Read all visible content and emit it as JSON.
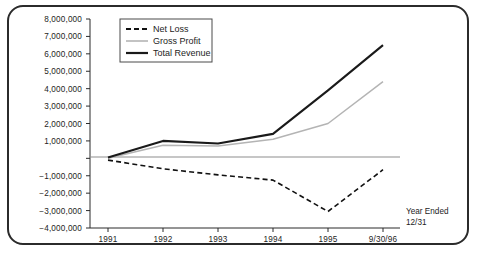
{
  "chart_data": {
    "type": "line",
    "title": "",
    "xlabel": "Year Ended 12/31",
    "ylabel": "",
    "categories": [
      "1991",
      "1992",
      "1993",
      "1994",
      "1995",
      "9/30/96"
    ],
    "ylim": [
      -4000000,
      8000000
    ],
    "ytick_values": [
      8000000,
      7000000,
      6000000,
      5000000,
      4000000,
      3000000,
      2000000,
      1000000,
      0,
      -1000000,
      -2000000,
      -3000000,
      -4000000
    ],
    "ytick_labels": [
      "8,000,000",
      "7,000,000",
      "6,000,000",
      "5,000,000",
      "4,000,000",
      "3,000,000",
      "2,000,000",
      "1,000,000",
      "",
      "−1,000,000",
      "−2,000,000",
      "−3,000,000",
      "−4,000,000"
    ],
    "grid": false,
    "legend_position": "top-left",
    "series": [
      {
        "name": "Net Loss",
        "style": "dashed",
        "color": "#111111",
        "values": [
          -100000,
          -600000,
          -950000,
          -1250000,
          -3050000,
          -650000
        ]
      },
      {
        "name": "Gross Profit",
        "style": "solid",
        "color": "#b4b4b4",
        "values": [
          0,
          750000,
          700000,
          1100000,
          2000000,
          4400000
        ]
      },
      {
        "name": "Total Revenue",
        "style": "solid-thick",
        "color": "#1a1a1a",
        "values": [
          50000,
          1000000,
          850000,
          1400000,
          3900000,
          6500000
        ]
      }
    ]
  },
  "axis_caption": {
    "line1": "Year Ended",
    "line2": "12/31"
  },
  "legend": {
    "entries": [
      {
        "label": "Net Loss"
      },
      {
        "label": "Gross Profit"
      },
      {
        "label": "Total Revenue"
      }
    ]
  }
}
